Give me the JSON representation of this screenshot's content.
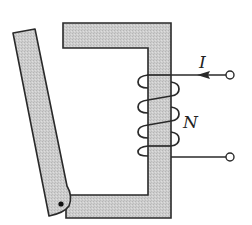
{
  "diagram": {
    "type": "electromagnet-relay",
    "labels": {
      "current": "I",
      "turns": "N"
    },
    "colors": {
      "core_fill": "#c9c9c9",
      "outline": "#2a2a2a",
      "background": "#ffffff"
    },
    "components": [
      "magnetic core (C-shaped)",
      "hinged armature",
      "pivot",
      "coil winding",
      "input terminal",
      "output terminal"
    ]
  }
}
